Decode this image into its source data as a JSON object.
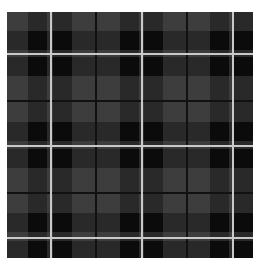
{
  "image": {
    "description": "Gray and black tartan plaid fabric pattern",
    "colors": {
      "base": "#3d3d3d",
      "stripe_band": "#2b2b2b",
      "intersection": "#0b0b0b",
      "white_line": "#c9c9c9",
      "dark_line": "#111111"
    },
    "pattern": {
      "period_px": 92,
      "vertical_bands": [
        [
          21,
          19
        ],
        [
          46,
          19
        ],
        [
          113,
          19
        ],
        [
          137,
          19
        ],
        [
          203,
          19
        ],
        [
          227,
          19
        ]
      ],
      "horizontal_bands": [
        [
          19,
          19
        ],
        [
          45,
          19
        ],
        [
          110,
          19
        ],
        [
          137,
          19
        ],
        [
          201,
          19
        ],
        [
          229,
          17
        ]
      ],
      "vertical_white_lines": [
        43,
        134,
        225
      ],
      "horizontal_white_lines": [
        41,
        133,
        225
      ],
      "vertical_dark_lines": [
        88,
        179
      ],
      "horizontal_dark_lines": [
        88,
        180
      ]
    }
  }
}
